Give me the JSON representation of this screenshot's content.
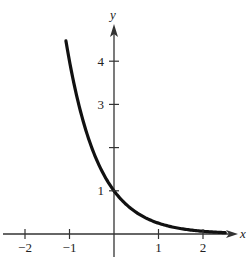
{
  "chart_data": {
    "type": "line",
    "title": "",
    "xlabel": "x",
    "ylabel": "y",
    "function": "y = 4^(-x)",
    "xlim": [
      -2.5,
      2.7
    ],
    "ylim": [
      -0.5,
      4.9
    ],
    "grid": false,
    "legend": null,
    "x_ticks": [
      {
        "value": -2,
        "label": "−2"
      },
      {
        "value": -1,
        "label": "−1"
      },
      {
        "value": 1,
        "label": "1"
      },
      {
        "value": 2,
        "label": "2"
      }
    ],
    "y_ticks": [
      {
        "value": 1,
        "label": "1"
      },
      {
        "value": 2,
        "label": ""
      },
      {
        "value": 3,
        "label": "3"
      },
      {
        "value": 4,
        "label": "4"
      }
    ],
    "series": [
      {
        "name": "curve",
        "x": [
          -1.08,
          -1,
          -0.75,
          -0.5,
          -0.25,
          0,
          0.25,
          0.5,
          0.75,
          1,
          1.25,
          1.5,
          1.75,
          2,
          2.25,
          2.5
        ],
        "y": [
          4.46,
          4.0,
          2.83,
          2.0,
          1.41,
          1.0,
          0.71,
          0.5,
          0.35,
          0.25,
          0.18,
          0.125,
          0.088,
          0.0625,
          0.044,
          0.031
        ]
      }
    ],
    "colors": {
      "axis": "#333333",
      "curve": "#111111"
    }
  }
}
